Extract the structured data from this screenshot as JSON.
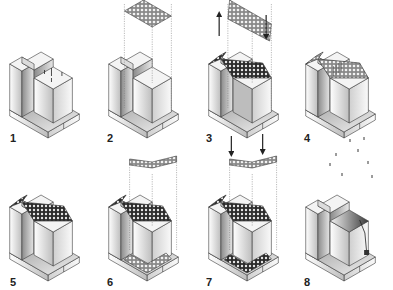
{
  "figure": {
    "steps": [
      {
        "label": "1",
        "roof": "none",
        "floating": "none",
        "base_grid": false,
        "arrows": "none",
        "rain": "pins",
        "dark_block": false
      },
      {
        "label": "2",
        "roof": "none",
        "floating": "flat",
        "base_grid": false,
        "arrows": "none",
        "rain": "none",
        "dark_block": false
      },
      {
        "label": "3",
        "roof": "slope",
        "floating": "slope",
        "base_grid": false,
        "arrows": "up-down",
        "rain": "none",
        "dark_block": true
      },
      {
        "label": "4",
        "roof": "slope-light",
        "floating": "none",
        "base_grid": false,
        "arrows": "none",
        "rain": "none",
        "dark_block": false
      },
      {
        "label": "5",
        "roof": "slope-dark",
        "floating": "none",
        "base_grid": false,
        "arrows": "none",
        "rain": "none",
        "dark_block": false
      },
      {
        "label": "6",
        "roof": "slope-dark",
        "floating": "corner",
        "base_grid": true,
        "arrows": "none",
        "rain": "none",
        "dark_block": false
      },
      {
        "label": "7",
        "roof": "slope-dark",
        "floating": "corner",
        "base_grid": true,
        "arrows": "down-down",
        "rain": "none",
        "dark_block": false
      },
      {
        "label": "8",
        "roof": "shaded",
        "floating": "none",
        "base_grid": false,
        "arrows": "none",
        "rain": "drops",
        "dark_block": false
      }
    ]
  },
  "colors": {
    "line": "#3a3a3a",
    "face_light": "#f4f4f4",
    "face_mid": "#dcdcdc",
    "face_dark": "#9a9a9a",
    "grid_dark": "#2e2e2e",
    "grid_light": "#bdbdbd"
  }
}
